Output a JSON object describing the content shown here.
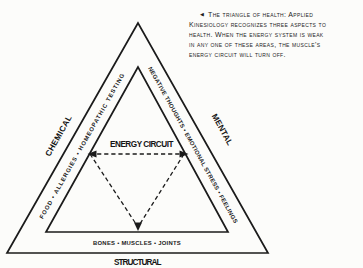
{
  "colors": {
    "ink": "#1b1b1b",
    "paper": "#fcfcfa"
  },
  "caption": {
    "arrow": "◀",
    "lines": [
      "The triangle of health: Applied",
      "Kinesiology recognizes three aspects to",
      "health. When the energy system is weak",
      "in any one of these areas, the muscle's",
      "energy circuit will turn off."
    ]
  },
  "diagram": {
    "center_label": "ENERGY CIRCUIT",
    "left_side": {
      "label": "CHEMICAL",
      "items": "FOOD • ALLERGIES • HOMEOPATHIC TESTING"
    },
    "right_side": {
      "label": "MENTAL",
      "items": "NEGATIVE THOUGHTS • EMOTIONAL STRESS • FEELINGS"
    },
    "bottom_side": {
      "label": "STRUCTURAL",
      "items": "BONES • MUSCLES • JOINTS"
    }
  }
}
